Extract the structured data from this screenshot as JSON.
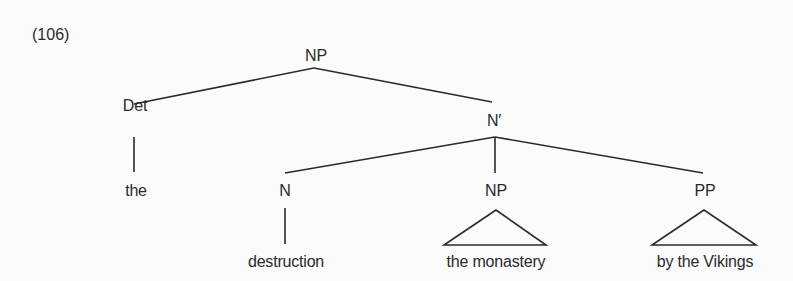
{
  "example_number": "(106)",
  "tree": {
    "root": {
      "label": "NP",
      "x": 316,
      "y": 48
    },
    "det": {
      "label": "Det",
      "x": 135,
      "y": 98
    },
    "nbar": {
      "label": "N′",
      "x": 494,
      "y": 113
    },
    "the_word": {
      "label": "the",
      "x": 136,
      "y": 183
    },
    "n": {
      "label": "N",
      "x": 285,
      "y": 183
    },
    "np_obj": {
      "label": "NP",
      "x": 496,
      "y": 183
    },
    "pp": {
      "label": "PP",
      "x": 705,
      "y": 183
    },
    "destruction": {
      "label": "destruction",
      "x": 286,
      "y": 254
    },
    "the_monastery": {
      "label": "the monastery",
      "x": 496,
      "y": 254
    },
    "by_the_vikings": {
      "label": "by the Vikings",
      "x": 705,
      "y": 254
    }
  },
  "edges": [
    {
      "from": "NP",
      "to": "Det",
      "x1": 314,
      "y1": 68,
      "x2": 134,
      "y2": 104
    },
    {
      "from": "NP",
      "to": "N'",
      "x1": 314,
      "y1": 68,
      "x2": 492,
      "y2": 102
    },
    {
      "from": "Det",
      "to": "the",
      "x1": 134,
      "y1": 137,
      "x2": 134,
      "y2": 172
    },
    {
      "from": "N'",
      "to": "N",
      "x1": 495,
      "y1": 137,
      "x2": 285,
      "y2": 173
    },
    {
      "from": "N'",
      "to": "NP",
      "x1": 495,
      "y1": 137,
      "x2": 495,
      "y2": 173
    },
    {
      "from": "N'",
      "to": "PP",
      "x1": 495,
      "y1": 137,
      "x2": 703,
      "y2": 173
    },
    {
      "from": "N",
      "to": "destruction",
      "x1": 285,
      "y1": 208,
      "x2": 285,
      "y2": 244
    }
  ],
  "triangles": [
    {
      "over": "NP",
      "text": "the monastery",
      "points": "496,210 444,245 546,245"
    },
    {
      "over": "PP",
      "text": "by the Vikings",
      "points": "704,210 652,245 756,245"
    }
  ],
  "colors": {
    "background": "#fbfbfb",
    "ink": "#2a2a2a"
  }
}
